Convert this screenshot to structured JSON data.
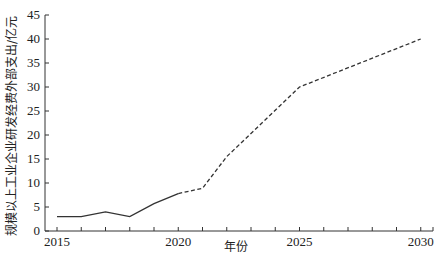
{
  "chart_data": {
    "type": "line",
    "title": "",
    "xlabel": "年份",
    "ylabel": "规模以上工业企业研发经费外部支出/亿元",
    "xlim": [
      2014.5,
      2030.5
    ],
    "ylim": [
      0,
      45
    ],
    "xticks": [
      2015,
      2020,
      2025,
      2030
    ],
    "yticks": [
      0,
      5,
      10,
      15,
      20,
      25,
      30,
      35,
      40,
      45
    ],
    "grid": false,
    "legend": null,
    "series": [
      {
        "name": "actual",
        "style": "solid",
        "x": [
          2015,
          2016,
          2017,
          2018,
          2019,
          2020
        ],
        "values": [
          3,
          3,
          4,
          3,
          5.7,
          7.8
        ]
      },
      {
        "name": "forecast",
        "style": "dashed",
        "x": [
          2020,
          2021,
          2022,
          2025,
          2030
        ],
        "values": [
          7.8,
          8.9,
          15.5,
          30,
          40
        ]
      }
    ]
  },
  "caption": "图"
}
